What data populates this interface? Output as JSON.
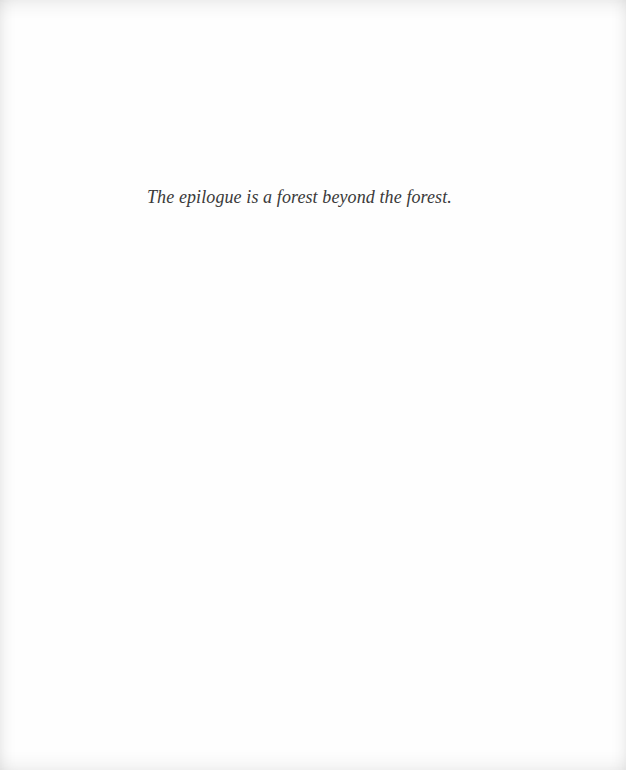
{
  "page": {
    "epigraph": "The epilogue is a forest beyond the forest."
  },
  "colors": {
    "background": "#fefefe",
    "text": "#3a3a3a"
  }
}
